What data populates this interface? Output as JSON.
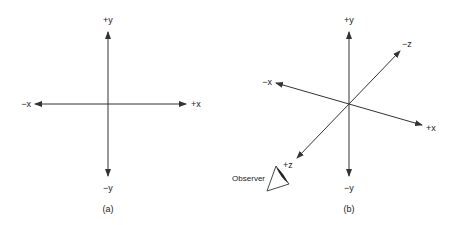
{
  "figure_a": {
    "caption": "(a)",
    "labels": {
      "pos_y": "+y",
      "neg_y": "−y",
      "pos_x": "+x",
      "neg_x": "−x"
    }
  },
  "figure_b": {
    "caption": "(b)",
    "labels": {
      "pos_y": "+y",
      "neg_y": "−y",
      "pos_x": "+x",
      "neg_x": "−x",
      "pos_z": "+z",
      "neg_z": "−z"
    },
    "observer_label": "Observer"
  },
  "colors": {
    "line": "#333333",
    "text": "#222222",
    "background": "#ffffff"
  }
}
